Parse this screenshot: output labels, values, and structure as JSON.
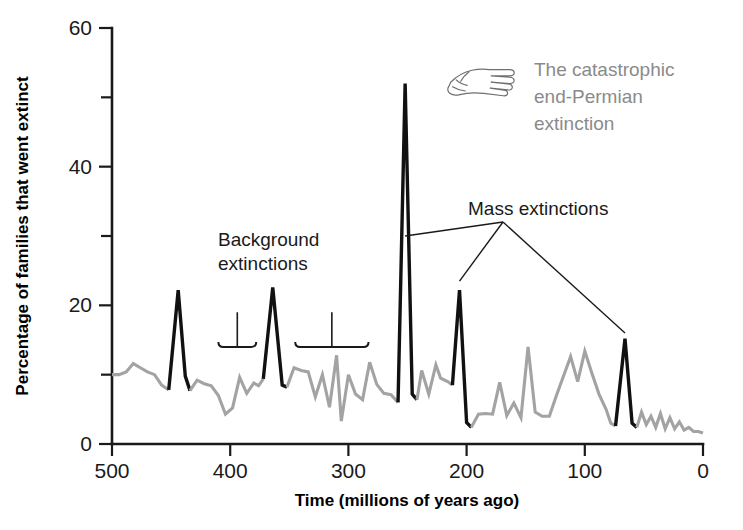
{
  "figure": {
    "background_color": "#ffffff"
  },
  "chart_data": {
    "type": "line",
    "title": "",
    "xlabel": "Time (millions of years ago)",
    "ylabel": "Percentage of families that went extinct",
    "xlim": [
      500,
      0
    ],
    "ylim": [
      0,
      60
    ],
    "x_reversed": true,
    "grid": false,
    "legend": "none",
    "xticks": [
      500,
      400,
      300,
      200,
      100,
      0
    ],
    "xtick_labels": [
      "500",
      "400",
      "300",
      "200",
      "100",
      "0"
    ],
    "yticks": [
      0,
      20,
      40,
      60
    ],
    "ytick_labels": [
      "0",
      "20",
      "40",
      "60"
    ],
    "yticks_minor": [
      10,
      30,
      50
    ],
    "colors": {
      "background_extinction": "#a3a3a3",
      "mass_extinction": "#111111",
      "annotation_gray": "#8a8a8a",
      "annotation_dark": "#1a1a1a",
      "axis": "#1a1a1a"
    },
    "series": [
      {
        "name": "Background extinctions",
        "color": "#a3a3a3",
        "style": "gray-line",
        "points": [
          [
            500,
            10.0
          ],
          [
            494,
            10.0
          ],
          [
            488,
            10.4
          ],
          [
            482,
            11.6
          ],
          [
            476,
            11.0
          ],
          [
            470,
            10.4
          ],
          [
            464,
            10.0
          ],
          [
            458,
            8.5
          ],
          [
            452,
            7.8
          ]
        ]
      },
      {
        "name": "Late Ordovician mass extinction",
        "color": "#111111",
        "style": "black-peak",
        "points": [
          [
            452,
            7.8
          ],
          [
            444,
            22.2
          ],
          [
            438,
            9.8
          ],
          [
            434,
            7.7
          ]
        ]
      },
      {
        "name": "Background extinctions 2",
        "color": "#a3a3a3",
        "style": "gray-line",
        "points": [
          [
            434,
            7.7
          ],
          [
            428,
            9.2
          ],
          [
            422,
            8.7
          ],
          [
            416,
            8.4
          ],
          [
            410,
            7.0
          ],
          [
            404,
            4.3
          ],
          [
            398,
            5.2
          ],
          [
            392,
            9.6
          ],
          [
            386,
            7.3
          ],
          [
            380,
            8.8
          ],
          [
            376,
            8.4
          ],
          [
            372,
            9.4
          ]
        ]
      },
      {
        "name": "Late Devonian mass extinction",
        "color": "#111111",
        "style": "black-peak",
        "points": [
          [
            372,
            9.4
          ],
          [
            364,
            22.6
          ],
          [
            356,
            8.5
          ],
          [
            352,
            8.2
          ]
        ]
      },
      {
        "name": "Background extinctions 3",
        "color": "#a3a3a3",
        "style": "gray-line",
        "points": [
          [
            352,
            8.2
          ],
          [
            346,
            11.0
          ],
          [
            340,
            10.6
          ],
          [
            334,
            10.4
          ],
          [
            328,
            6.8
          ],
          [
            322,
            10.0
          ],
          [
            316,
            5.3
          ],
          [
            310,
            12.8
          ],
          [
            306,
            3.3
          ],
          [
            300,
            10.0
          ],
          [
            294,
            7.2
          ],
          [
            288,
            6.4
          ],
          [
            282,
            11.8
          ],
          [
            276,
            8.6
          ],
          [
            270,
            7.3
          ],
          [
            264,
            7.1
          ],
          [
            258,
            6.0
          ]
        ]
      },
      {
        "name": "End-Permian mass extinction",
        "color": "#111111",
        "style": "black-peak",
        "points": [
          [
            258,
            6.0
          ],
          [
            252,
            52.0
          ],
          [
            246,
            7.2
          ],
          [
            242,
            6.4
          ]
        ]
      },
      {
        "name": "Background extinctions 4",
        "color": "#a3a3a3",
        "style": "gray-line",
        "points": [
          [
            242,
            6.4
          ],
          [
            238,
            10.6
          ],
          [
            232,
            7.2
          ],
          [
            226,
            11.4
          ],
          [
            222,
            9.5
          ],
          [
            216,
            9.0
          ],
          [
            212,
            8.5
          ]
        ]
      },
      {
        "name": "End-Triassic mass extinction",
        "color": "#111111",
        "style": "black-peak",
        "points": [
          [
            212,
            8.5
          ],
          [
            206,
            22.2
          ],
          [
            200,
            3.1
          ],
          [
            196,
            2.4
          ]
        ]
      },
      {
        "name": "Background extinctions 5",
        "color": "#a3a3a3",
        "style": "gray-line",
        "points": [
          [
            196,
            2.4
          ],
          [
            190,
            4.3
          ],
          [
            184,
            4.4
          ],
          [
            178,
            4.3
          ],
          [
            172,
            8.9
          ],
          [
            166,
            4.1
          ],
          [
            160,
            5.9
          ],
          [
            154,
            3.8
          ],
          [
            148,
            14.0
          ],
          [
            142,
            4.6
          ],
          [
            136,
            4.0
          ],
          [
            130,
            4.0
          ],
          [
            124,
            7.0
          ],
          [
            118,
            9.8
          ],
          [
            112,
            12.6
          ],
          [
            106,
            9.0
          ],
          [
            100,
            13.4
          ],
          [
            94,
            10.2
          ],
          [
            88,
            7.2
          ],
          [
            82,
            5.0
          ],
          [
            78,
            3.0
          ],
          [
            74,
            2.6
          ]
        ]
      },
      {
        "name": "End-Cretaceous mass extinction",
        "color": "#111111",
        "style": "black-peak",
        "points": [
          [
            74,
            2.6
          ],
          [
            66,
            15.2
          ],
          [
            60,
            3.0
          ],
          [
            56,
            2.4
          ]
        ]
      },
      {
        "name": "Background extinctions 6",
        "color": "#a3a3a3",
        "style": "gray-line",
        "points": [
          [
            56,
            2.4
          ],
          [
            52,
            4.6
          ],
          [
            48,
            2.8
          ],
          [
            44,
            4.0
          ],
          [
            40,
            2.4
          ],
          [
            36,
            4.4
          ],
          [
            32,
            2.2
          ],
          [
            28,
            3.8
          ],
          [
            24,
            2.2
          ],
          [
            20,
            3.2
          ],
          [
            16,
            2.0
          ],
          [
            12,
            2.4
          ],
          [
            8,
            1.8
          ],
          [
            4,
            1.8
          ],
          [
            0,
            1.6
          ]
        ]
      }
    ],
    "annotations": [
      {
        "id": "background-extinctions",
        "text_lines": [
          "Background",
          "extinctions"
        ],
        "color": "#1a1a1a",
        "kind": "brackets",
        "brackets": [
          {
            "x_start": 410,
            "x_end": 378,
            "y": 14.0,
            "stem_to_y": 19.0
          },
          {
            "x_start": 345,
            "x_end": 283,
            "y": 14.0,
            "stem_to_y": 19.0
          }
        ]
      },
      {
        "id": "mass-extinctions",
        "text": "Mass extinctions",
        "color": "#1a1a1a",
        "kind": "leader-lines",
        "targets": [
          [
            252,
            30.0
          ],
          [
            206,
            23.5
          ],
          [
            66,
            16.0
          ]
        ]
      },
      {
        "id": "end-permian-callout",
        "text_lines": [
          "The catastrophic",
          "end-Permian",
          "extinction"
        ],
        "color": "#8a8a8a",
        "kind": "hand-pointer",
        "icon": "pointing-hand-icon"
      }
    ]
  }
}
